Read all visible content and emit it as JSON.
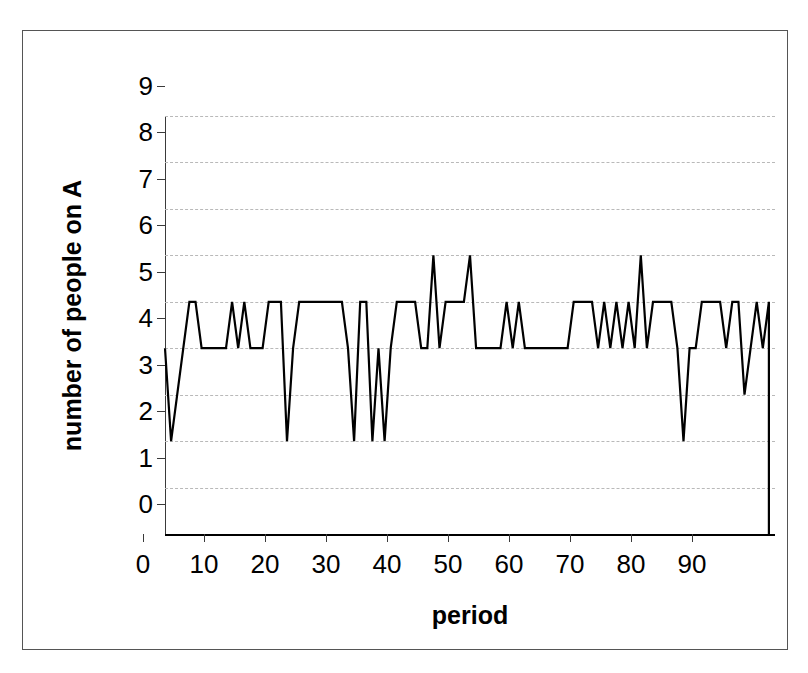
{
  "chart_data": {
    "type": "line",
    "title": "",
    "xlabel": "period",
    "ylabel": "number of people on A",
    "xlim": [
      0,
      100
    ],
    "ylim": [
      0,
      9
    ],
    "grid": true,
    "legend": false,
    "line_color": "#000000",
    "x_ticks": [
      0,
      10,
      20,
      30,
      40,
      50,
      60,
      70,
      80,
      90
    ],
    "y_ticks": [
      0,
      1,
      2,
      3,
      4,
      5,
      6,
      7,
      8,
      9
    ],
    "x_tick_labels": [
      "0",
      "10",
      "20",
      "30",
      "40",
      "50",
      "60",
      "70",
      "80",
      "90"
    ],
    "y_tick_labels": [
      "0",
      "1",
      "2",
      "3",
      "4",
      "5",
      "6",
      "7",
      "8",
      "9"
    ],
    "series": [
      {
        "name": "number of people on A",
        "x": [
          0,
          1,
          2,
          3,
          4,
          5,
          6,
          7,
          8,
          9,
          10,
          11,
          12,
          13,
          14,
          15,
          16,
          17,
          18,
          19,
          20,
          21,
          22,
          23,
          24,
          25,
          26,
          27,
          28,
          29,
          30,
          31,
          32,
          33,
          34,
          35,
          36,
          37,
          38,
          39,
          40,
          41,
          42,
          43,
          44,
          45,
          46,
          47,
          48,
          49,
          50,
          51,
          52,
          53,
          54,
          55,
          56,
          57,
          58,
          59,
          60,
          61,
          62,
          63,
          64,
          65,
          66,
          67,
          68,
          69,
          70,
          71,
          72,
          73,
          74,
          75,
          76,
          77,
          78,
          79,
          80,
          81,
          82,
          83,
          84,
          85,
          86,
          87,
          88,
          89,
          90,
          91,
          92,
          93,
          94,
          95,
          96,
          97,
          98,
          99
        ],
        "values": [
          4,
          2,
          3,
          4,
          5,
          5,
          4,
          4,
          4,
          4,
          4,
          5,
          4,
          5,
          4,
          4,
          4,
          5,
          5,
          5,
          2,
          4,
          5,
          5,
          5,
          5,
          5,
          5,
          5,
          5,
          4,
          2,
          5,
          5,
          2,
          4,
          2,
          4,
          5,
          5,
          5,
          5,
          4,
          4,
          6,
          4,
          5,
          5,
          5,
          5,
          6,
          4,
          4,
          4,
          4,
          4,
          5,
          4,
          5,
          4,
          4,
          4,
          4,
          4,
          4,
          4,
          4,
          5,
          5,
          5,
          5,
          4,
          5,
          4,
          5,
          4,
          5,
          4,
          6,
          4,
          5,
          5,
          5,
          5,
          4,
          2,
          4,
          4,
          5,
          5,
          5,
          5,
          4,
          5,
          5,
          3,
          4,
          5,
          4,
          5
        ]
      }
    ],
    "trailing_drop_to_zero": true
  },
  "axes": {
    "y_title": "number of people on A",
    "x_title": "period"
  }
}
